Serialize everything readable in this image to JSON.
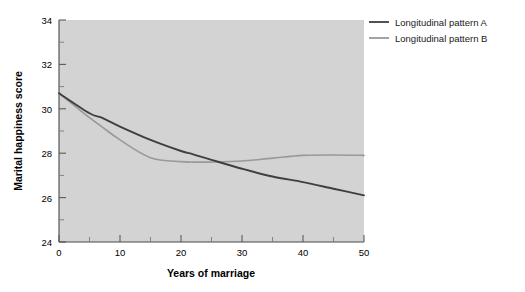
{
  "chart_data": {
    "type": "line",
    "title": "",
    "xlabel": "Years of marriage",
    "ylabel": "Marital happiness score",
    "xlim": [
      0,
      50
    ],
    "ylim": [
      24,
      34
    ],
    "grid": false,
    "legend_position": "top-right-outside",
    "x_ticks": [
      "0",
      "10",
      "20",
      "30",
      "40",
      "50"
    ],
    "x_tick_values": [
      0,
      10,
      20,
      30,
      40,
      50
    ],
    "x_minor_tick_values": [
      5,
      15,
      25,
      35,
      45
    ],
    "y_ticks": [
      "24",
      "26",
      "28",
      "30",
      "32",
      "34"
    ],
    "y_tick_values": [
      24,
      26,
      28,
      30,
      32,
      34
    ],
    "y_minor_tick_values": [
      25,
      27,
      29,
      31,
      33
    ],
    "x": [
      0,
      5,
      7,
      10,
      15,
      20,
      22,
      25,
      30,
      35,
      40,
      45,
      50
    ],
    "series": [
      {
        "name": "Longitudinal pattern A",
        "color": "#3f3f3f",
        "values": [
          30.7,
          29.8,
          29.6,
          29.2,
          28.6,
          28.1,
          27.95,
          27.7,
          27.3,
          26.95,
          26.7,
          26.4,
          26.1
        ]
      },
      {
        "name": "Longitudinal pattern B",
        "color": "#999999",
        "values": [
          30.7,
          29.6,
          29.2,
          28.6,
          27.8,
          27.62,
          27.6,
          27.6,
          27.65,
          27.78,
          27.9,
          27.92,
          27.9
        ]
      }
    ],
    "legend": [
      {
        "label": "Longitudinal pattern A",
        "color": "#3f3f3f"
      },
      {
        "label": "Longitudinal pattern B",
        "color": "#999999"
      }
    ],
    "colors": {
      "plot_background": "#d3d3d3",
      "page_background": "#ffffff",
      "axis": "#4a4a4a",
      "pattern_a": "#3f3f3f",
      "pattern_b": "#999999"
    }
  }
}
